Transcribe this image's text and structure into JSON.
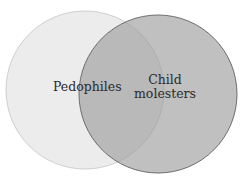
{
  "diagram": {
    "type": "venn",
    "sets": [
      {
        "label": "Pedophiles",
        "fill": "#ececec",
        "stroke": "#c8c8c8"
      },
      {
        "label_lines": [
          "Child",
          "molesters"
        ],
        "fill": "#a8a8a8",
        "stroke": "#6e6e6e",
        "opacity": 0.62
      }
    ],
    "overlap_fill": "#a9a9a9"
  }
}
